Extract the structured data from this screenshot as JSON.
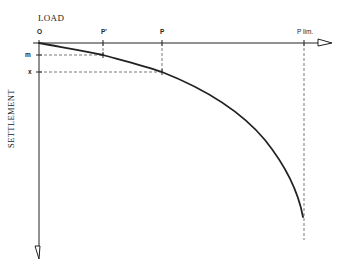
{
  "diagram": {
    "type": "load-settlement curve",
    "x_axis_title": "LOAD",
    "y_axis_title": "SETTLEMENT",
    "origin_label": "O",
    "load_labels": {
      "p_prime": "P'",
      "p": "P",
      "p_lim": "P lim."
    },
    "settlement_labels": {
      "m": "m",
      "x": "x"
    },
    "colors": {
      "line": "#222222",
      "dashed": "#555555",
      "background": "#ffffff"
    }
  }
}
